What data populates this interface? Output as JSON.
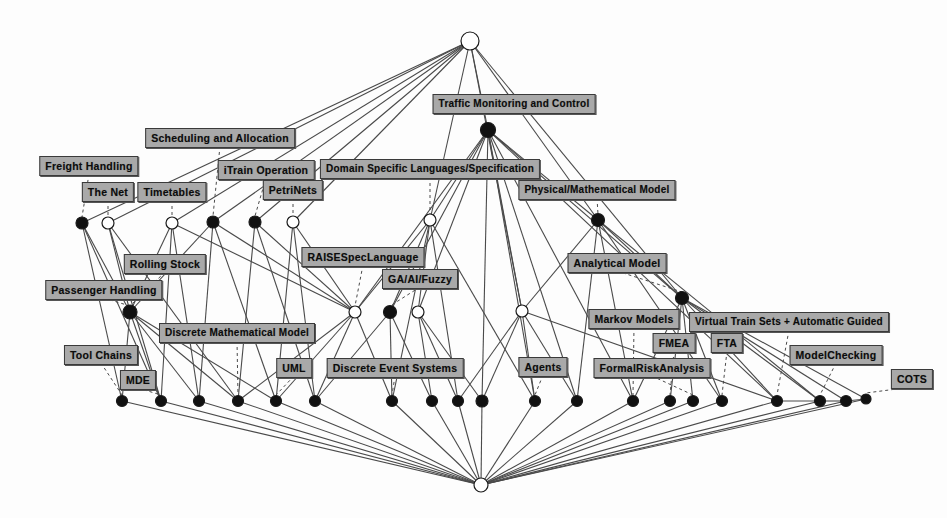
{
  "diagram": {
    "type": "concept-lattice",
    "canvas": {
      "width": 947,
      "height": 518
    },
    "style": {
      "box_fill": "#a9a9a9",
      "box_border": "#3a3a3a",
      "text_color": "#0c0c0c",
      "edge_color": "#4a4a4a",
      "node_filled": "#111111",
      "node_open": "#ffffff",
      "background": "#ffffff"
    },
    "labels": [
      {
        "id": "traffic",
        "text": "Traffic Monitoring and Control",
        "x": 514,
        "y": 104
      },
      {
        "id": "sched",
        "text": "Scheduling and Allocation",
        "x": 220,
        "y": 138
      },
      {
        "id": "freight",
        "text": "Freight Handling",
        "x": 89,
        "y": 166
      },
      {
        "id": "trainop",
        "text": "iTrain Operation",
        "x": 266,
        "y": 170
      },
      {
        "id": "dsl",
        "text": "Domain Specific Languages/Specification",
        "x": 430,
        "y": 169
      },
      {
        "id": "thenet",
        "text": "The Net",
        "x": 108,
        "y": 192
      },
      {
        "id": "timetables",
        "text": "Timetables",
        "x": 172,
        "y": 192
      },
      {
        "id": "petrinets",
        "text": "PetriNets",
        "x": 293,
        "y": 190
      },
      {
        "id": "physmath",
        "text": "Physical/Mathematical Model",
        "x": 597,
        "y": 190
      },
      {
        "id": "raise",
        "text": "RAISESpecLanguage",
        "x": 363,
        "y": 257
      },
      {
        "id": "rolling",
        "text": "Rolling Stock",
        "x": 165,
        "y": 264
      },
      {
        "id": "analytical",
        "text": "Analytical Model",
        "x": 617,
        "y": 263
      },
      {
        "id": "gaai",
        "text": "GA/AI/Fuzzy",
        "x": 420,
        "y": 279
      },
      {
        "id": "passenger",
        "text": "Passenger Handling",
        "x": 104,
        "y": 290
      },
      {
        "id": "markov",
        "text": "Markov Models",
        "x": 634,
        "y": 319
      },
      {
        "id": "virtual",
        "text": "Virtual Train Sets + Automatic Guided",
        "x": 789,
        "y": 322
      },
      {
        "id": "dmm",
        "text": "Discrete Mathematical Model",
        "x": 237,
        "y": 333
      },
      {
        "id": "fmea",
        "text": "FMEA",
        "x": 674,
        "y": 343
      },
      {
        "id": "fta",
        "text": "FTA",
        "x": 727,
        "y": 343
      },
      {
        "id": "toolchains",
        "text": "Tool Chains",
        "x": 101,
        "y": 355
      },
      {
        "id": "des",
        "text": "Discrete Event Systems",
        "x": 395,
        "y": 368
      },
      {
        "id": "uml",
        "text": "UML",
        "x": 294,
        "y": 368
      },
      {
        "id": "agents",
        "text": "Agents",
        "x": 543,
        "y": 367
      },
      {
        "id": "formalrisk",
        "text": "FormalRiskAnalysis",
        "x": 652,
        "y": 368
      },
      {
        "id": "modelcheck",
        "text": "ModelChecking",
        "x": 836,
        "y": 355
      },
      {
        "id": "mde",
        "text": "MDE",
        "x": 138,
        "y": 380
      },
      {
        "id": "cots",
        "text": "COTS",
        "x": 912,
        "y": 379
      }
    ],
    "nodes": [
      {
        "id": "top",
        "x": 470,
        "y": 41,
        "r": 9,
        "fill": "open"
      },
      {
        "id": "n1",
        "x": 488,
        "y": 130,
        "r": 7.5,
        "fill": "filled"
      },
      {
        "id": "a1",
        "x": 82,
        "y": 223,
        "r": 6,
        "fill": "filled"
      },
      {
        "id": "a2",
        "x": 108,
        "y": 223,
        "r": 6,
        "fill": "open"
      },
      {
        "id": "a3",
        "x": 172,
        "y": 223,
        "r": 6,
        "fill": "open"
      },
      {
        "id": "a4",
        "x": 213,
        "y": 222,
        "r": 6,
        "fill": "filled"
      },
      {
        "id": "a5",
        "x": 255,
        "y": 222,
        "r": 6,
        "fill": "filled"
      },
      {
        "id": "a6",
        "x": 293,
        "y": 222,
        "r": 6,
        "fill": "open"
      },
      {
        "id": "a7",
        "x": 430,
        "y": 220,
        "r": 6,
        "fill": "open"
      },
      {
        "id": "a8",
        "x": 598,
        "y": 220,
        "r": 6.5,
        "fill": "filled"
      },
      {
        "id": "b1",
        "x": 130,
        "y": 312,
        "r": 7,
        "fill": "filled"
      },
      {
        "id": "b2",
        "x": 355,
        "y": 312,
        "r": 6,
        "fill": "open"
      },
      {
        "id": "b3",
        "x": 390,
        "y": 312,
        "r": 6.5,
        "fill": "filled"
      },
      {
        "id": "b4",
        "x": 418,
        "y": 312,
        "r": 6,
        "fill": "open"
      },
      {
        "id": "b5",
        "x": 522,
        "y": 311,
        "r": 6,
        "fill": "open"
      },
      {
        "id": "b6",
        "x": 682,
        "y": 298,
        "r": 6.5,
        "fill": "filled"
      },
      {
        "id": "c1",
        "x": 122,
        "y": 401,
        "r": 5.5,
        "fill": "filled"
      },
      {
        "id": "c2",
        "x": 161,
        "y": 401,
        "r": 5.5,
        "fill": "filled"
      },
      {
        "id": "c3",
        "x": 199,
        "y": 401,
        "r": 5.5,
        "fill": "filled"
      },
      {
        "id": "c4",
        "x": 238,
        "y": 401,
        "r": 5.5,
        "fill": "filled"
      },
      {
        "id": "c5",
        "x": 276,
        "y": 401,
        "r": 5.5,
        "fill": "filled"
      },
      {
        "id": "c6",
        "x": 315,
        "y": 401,
        "r": 5.5,
        "fill": "filled"
      },
      {
        "id": "c7",
        "x": 392,
        "y": 401,
        "r": 5.5,
        "fill": "filled"
      },
      {
        "id": "c8",
        "x": 432,
        "y": 401,
        "r": 5.5,
        "fill": "filled"
      },
      {
        "id": "c9",
        "x": 458,
        "y": 401,
        "r": 5.5,
        "fill": "filled"
      },
      {
        "id": "c10",
        "x": 482,
        "y": 401,
        "r": 6,
        "fill": "filled"
      },
      {
        "id": "c11",
        "x": 535,
        "y": 401,
        "r": 5.5,
        "fill": "filled"
      },
      {
        "id": "c12",
        "x": 577,
        "y": 401,
        "r": 5.5,
        "fill": "filled"
      },
      {
        "id": "c13",
        "x": 633,
        "y": 401,
        "r": 5.5,
        "fill": "filled"
      },
      {
        "id": "c14",
        "x": 670,
        "y": 401,
        "r": 5.5,
        "fill": "filled"
      },
      {
        "id": "c15",
        "x": 693,
        "y": 401,
        "r": 5.5,
        "fill": "filled"
      },
      {
        "id": "c16",
        "x": 722,
        "y": 401,
        "r": 5.5,
        "fill": "filled"
      },
      {
        "id": "c17",
        "x": 777,
        "y": 401,
        "r": 5.5,
        "fill": "filled"
      },
      {
        "id": "c18",
        "x": 820,
        "y": 401,
        "r": 5.5,
        "fill": "filled"
      },
      {
        "id": "c19",
        "x": 846,
        "y": 401,
        "r": 5.5,
        "fill": "filled"
      },
      {
        "id": "c20",
        "x": 866,
        "y": 399,
        "r": 5,
        "fill": "filled"
      },
      {
        "id": "bot",
        "x": 481,
        "y": 485,
        "r": 7,
        "fill": "open"
      }
    ],
    "edges": [
      [
        "top",
        "a1"
      ],
      [
        "top",
        "a2"
      ],
      [
        "top",
        "a3"
      ],
      [
        "top",
        "a4"
      ],
      [
        "top",
        "a5"
      ],
      [
        "top",
        "a6"
      ],
      [
        "top",
        "a7"
      ],
      [
        "top",
        "a8"
      ],
      [
        "top",
        "n1"
      ],
      [
        "top",
        "b5"
      ],
      [
        "top",
        "b6"
      ],
      [
        "n1",
        "a7"
      ],
      [
        "n1",
        "a8"
      ],
      [
        "n1",
        "b2"
      ],
      [
        "n1",
        "b3"
      ],
      [
        "n1",
        "b4"
      ],
      [
        "n1",
        "b5"
      ],
      [
        "n1",
        "b6"
      ],
      [
        "n1",
        "c10"
      ],
      [
        "n1",
        "c11"
      ],
      [
        "n1",
        "c12"
      ],
      [
        "n1",
        "c13"
      ],
      [
        "n1",
        "c17"
      ],
      [
        "a1",
        "b1"
      ],
      [
        "a2",
        "b1"
      ],
      [
        "a2",
        "c2"
      ],
      [
        "a3",
        "c3"
      ],
      [
        "a3",
        "b1"
      ],
      [
        "a4",
        "b1"
      ],
      [
        "a4",
        "c5"
      ],
      [
        "a5",
        "c6"
      ],
      [
        "a5",
        "b2"
      ],
      [
        "a6",
        "b2"
      ],
      [
        "a6",
        "c6"
      ],
      [
        "a3",
        "b2"
      ],
      [
        "a4",
        "b2"
      ],
      [
        "a7",
        "b2"
      ],
      [
        "a7",
        "b3"
      ],
      [
        "a7",
        "b4"
      ],
      [
        "a7",
        "c7"
      ],
      [
        "a7",
        "c9"
      ],
      [
        "a8",
        "b5"
      ],
      [
        "a8",
        "b6"
      ],
      [
        "a8",
        "c12"
      ],
      [
        "a8",
        "c13"
      ],
      [
        "a8",
        "c16"
      ],
      [
        "b1",
        "c1"
      ],
      [
        "b1",
        "c2"
      ],
      [
        "b1",
        "c3"
      ],
      [
        "b1",
        "c4"
      ],
      [
        "b2",
        "c5"
      ],
      [
        "b2",
        "c6"
      ],
      [
        "b2",
        "c7"
      ],
      [
        "b3",
        "c7"
      ],
      [
        "b3",
        "c8"
      ],
      [
        "b4",
        "c8"
      ],
      [
        "b4",
        "c9"
      ],
      [
        "b5",
        "c10"
      ],
      [
        "b5",
        "c11"
      ],
      [
        "b5",
        "c12"
      ],
      [
        "b6",
        "c13"
      ],
      [
        "b6",
        "c14"
      ],
      [
        "b6",
        "c15"
      ],
      [
        "b6",
        "c16"
      ],
      [
        "b6",
        "c17"
      ],
      [
        "a1",
        "c1"
      ],
      [
        "a2",
        "c4"
      ],
      [
        "a5",
        "c4"
      ],
      [
        "a6",
        "c5"
      ],
      [
        "b2",
        "c4"
      ],
      [
        "b3",
        "c6"
      ],
      [
        "b4",
        "c10"
      ],
      [
        "b5",
        "c9"
      ],
      [
        "a7",
        "c11"
      ],
      [
        "a8",
        "c18"
      ],
      [
        "b6",
        "c18"
      ],
      [
        "b5",
        "c17"
      ],
      [
        "b1",
        "c5"
      ],
      [
        "a4",
        "c3"
      ],
      [
        "a3",
        "c2"
      ],
      [
        "a1",
        "c2"
      ],
      [
        "c1",
        "bot"
      ],
      [
        "c2",
        "bot"
      ],
      [
        "c3",
        "bot"
      ],
      [
        "c4",
        "bot"
      ],
      [
        "c5",
        "bot"
      ],
      [
        "c6",
        "bot"
      ],
      [
        "c7",
        "bot"
      ],
      [
        "c8",
        "bot"
      ],
      [
        "c9",
        "bot"
      ],
      [
        "c10",
        "bot"
      ],
      [
        "c11",
        "bot"
      ],
      [
        "c12",
        "bot"
      ],
      [
        "c13",
        "bot"
      ],
      [
        "c14",
        "bot"
      ],
      [
        "c15",
        "bot"
      ],
      [
        "c16",
        "bot"
      ],
      [
        "c17",
        "bot"
      ],
      [
        "c18",
        "bot"
      ],
      [
        "c19",
        "bot"
      ],
      [
        "c20",
        "bot"
      ],
      [
        "c18",
        "c19"
      ],
      [
        "c19",
        "c20"
      ],
      [
        "c17",
        "c18"
      ],
      [
        "b6",
        "c19"
      ],
      [
        "b6",
        "c20"
      ]
    ],
    "label_stems": [
      {
        "from": "freight",
        "to": "a1"
      },
      {
        "from": "thenet",
        "to": "a2"
      },
      {
        "from": "timetables",
        "to": "a3"
      },
      {
        "from": "sched",
        "to": "a4"
      },
      {
        "from": "trainop",
        "to": "a5"
      },
      {
        "from": "petrinets",
        "to": "a6"
      },
      {
        "from": "dsl",
        "to": "a7"
      },
      {
        "from": "physmath",
        "to": "a8"
      },
      {
        "from": "passenger",
        "to": "b1"
      },
      {
        "from": "rolling",
        "to": "b1"
      },
      {
        "from": "raise",
        "to": "b2"
      },
      {
        "from": "gaai",
        "to": "b3"
      },
      {
        "from": "analytical",
        "to": "b6"
      },
      {
        "from": "toolchains",
        "to": "c1"
      },
      {
        "from": "mde",
        "to": "c2"
      },
      {
        "from": "dmm",
        "to": "c4"
      },
      {
        "from": "uml",
        "to": "c5"
      },
      {
        "from": "des",
        "to": "c7"
      },
      {
        "from": "agents",
        "to": "c11"
      },
      {
        "from": "markov",
        "to": "c13"
      },
      {
        "from": "fmea",
        "to": "c14"
      },
      {
        "from": "formalrisk",
        "to": "c15"
      },
      {
        "from": "fta",
        "to": "c16"
      },
      {
        "from": "virtual",
        "to": "c17"
      },
      {
        "from": "modelcheck",
        "to": "c18"
      },
      {
        "from": "cots",
        "to": "c20"
      }
    ]
  }
}
